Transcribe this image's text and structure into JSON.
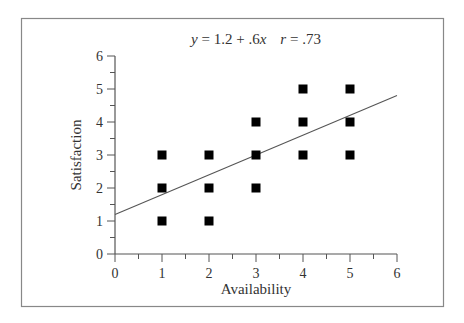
{
  "chart_data": {
    "type": "scatter",
    "title_parts": {
      "equation_y": "y",
      "equation_rest": " = 1.2 + .6",
      "equation_x": "x",
      "r_symbol": "r",
      "r_rest": " = .73"
    },
    "xlabel": "Availability",
    "ylabel": "Satisfaction",
    "xlim": [
      0,
      6
    ],
    "ylim": [
      0,
      6
    ],
    "x_ticks": [
      0,
      1,
      2,
      3,
      4,
      5,
      6
    ],
    "y_ticks": [
      0,
      1,
      2,
      3,
      4,
      5,
      6
    ],
    "grid": false,
    "legend": null,
    "series": [
      {
        "name": "observations",
        "marker": "square",
        "color": "#000000",
        "points": [
          {
            "x": 1,
            "y": 1
          },
          {
            "x": 1,
            "y": 2
          },
          {
            "x": 1,
            "y": 3
          },
          {
            "x": 2,
            "y": 1
          },
          {
            "x": 2,
            "y": 2
          },
          {
            "x": 2,
            "y": 3
          },
          {
            "x": 3,
            "y": 2
          },
          {
            "x": 3,
            "y": 3
          },
          {
            "x": 3,
            "y": 4
          },
          {
            "x": 4,
            "y": 3
          },
          {
            "x": 4,
            "y": 4
          },
          {
            "x": 4,
            "y": 5
          },
          {
            "x": 5,
            "y": 3
          },
          {
            "x": 5,
            "y": 4
          },
          {
            "x": 5,
            "y": 5
          }
        ]
      }
    ],
    "regression_line": {
      "intercept": 1.2,
      "slope": 0.6,
      "r": 0.73,
      "x_range": [
        0,
        6
      ],
      "color": "#555555"
    }
  },
  "colors": {
    "frame": "#888888",
    "axis": "#555555",
    "marker": "#000000",
    "text": "#333333"
  }
}
